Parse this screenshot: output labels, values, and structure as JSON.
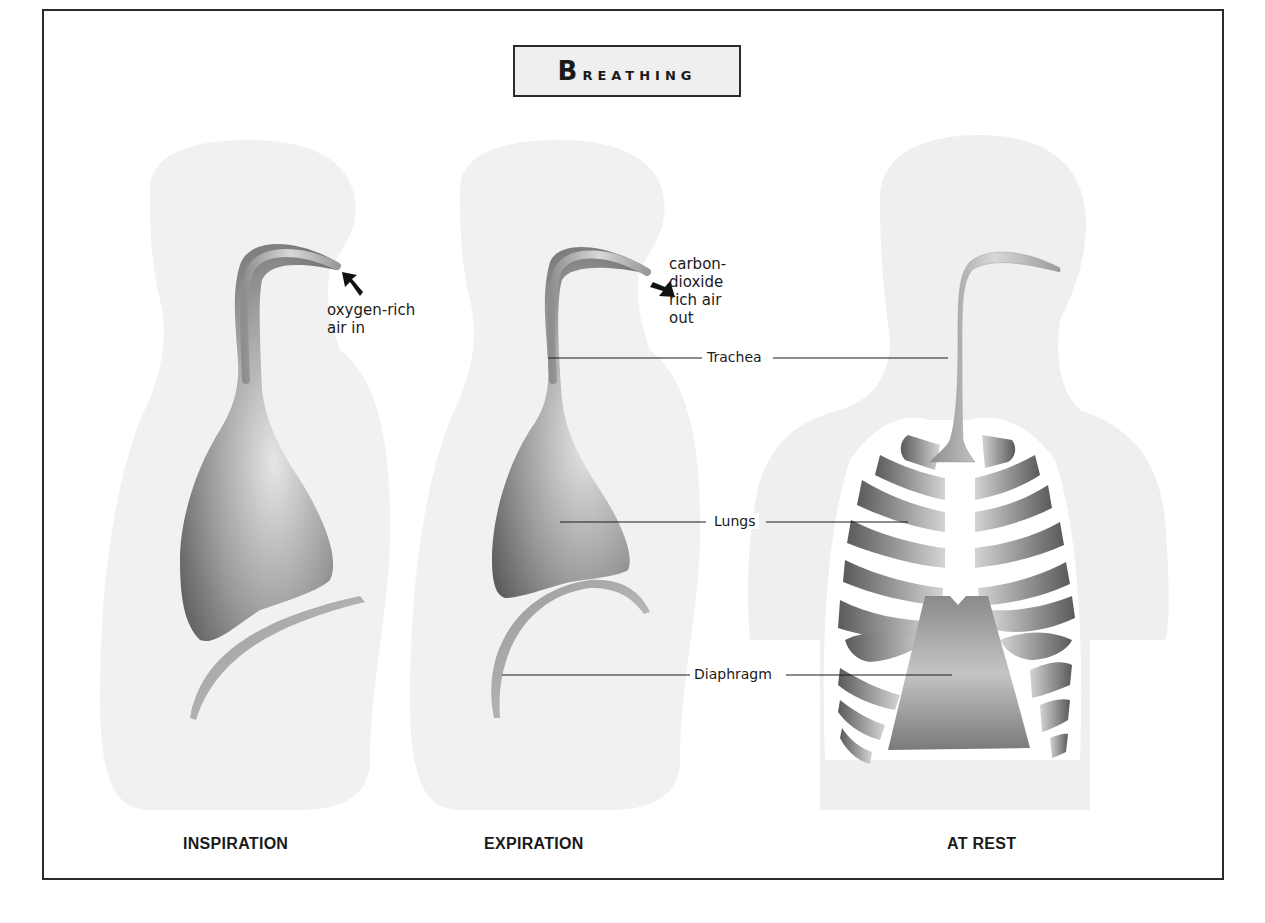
{
  "title": "Breathing",
  "panels": [
    {
      "id": "inspiration",
      "caption": "INSPIRATION",
      "note_lines": [
        "oxygen-rich",
        "air in"
      ],
      "arrow": "air-in-arrow"
    },
    {
      "id": "expiration",
      "caption": "EXPIRATION",
      "note_lines": [
        "carbon-",
        "dioxide",
        "rich air",
        "out"
      ],
      "arrow": "air-out-arrow"
    },
    {
      "id": "at_rest",
      "caption": "AT REST"
    }
  ],
  "labels": {
    "trachea": "Trachea",
    "lungs": "Lungs",
    "diaphragm": "Diaphragm"
  },
  "colors": {
    "frame": "#2b2b2b",
    "title_bg": "#efefef",
    "silhouette": "#f0f0f0",
    "organ_dark": "#6e6e6e",
    "organ_light": "#d9d9d9",
    "leader_line": "#1a1a1a"
  }
}
